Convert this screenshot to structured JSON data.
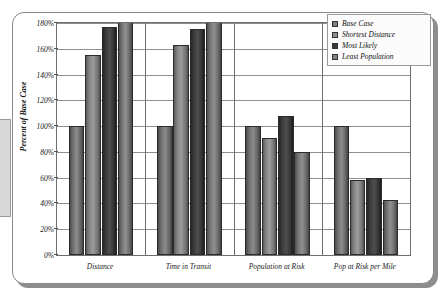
{
  "chart_data": {
    "type": "bar",
    "title": "",
    "xlabel": "",
    "ylabel": "Percent of Base Case",
    "ylim": [
      0,
      180
    ],
    "ytick_labels": [
      "180%",
      "160%",
      "140%",
      "120%",
      "100%",
      "80%",
      "60%",
      "40%",
      "20%",
      "0%"
    ],
    "ytick_values": [
      180,
      160,
      140,
      120,
      100,
      80,
      60,
      40,
      20,
      0
    ],
    "grid": true,
    "legend_position": "top-right",
    "categories": [
      "Distance",
      "Time in Transit",
      "Population at Risk",
      "Pop at Risk per Mile"
    ],
    "series": [
      {
        "name": "Base Case",
        "color": "#7c7c7c",
        "values": [
          100,
          100,
          100,
          100
        ]
      },
      {
        "name": "Shortest Distance",
        "color": "#909090",
        "values": [
          155,
          163,
          91,
          58
        ]
      },
      {
        "name": "Most Likely",
        "color": "#3a3a3a",
        "values": [
          177,
          175,
          108,
          60
        ]
      },
      {
        "name": "Least Population",
        "color": "#848484",
        "values": [
          183,
          192,
          80,
          43
        ]
      }
    ]
  }
}
